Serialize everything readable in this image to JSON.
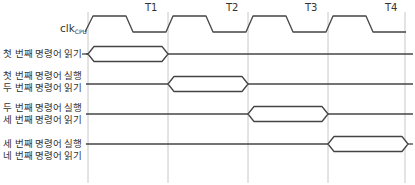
{
  "clock": {
    "label": "clk",
    "subscript": "CPU"
  },
  "periods": [
    {
      "label": "T1",
      "x": 150
    },
    {
      "label": "T2",
      "x": 231
    },
    {
      "label": "T3",
      "x": 311
    },
    {
      "label": "T4",
      "x": 391
    }
  ],
  "gridlines_x": [
    88,
    168,
    248,
    328,
    405
  ],
  "rows": [
    {
      "lines": [
        "첫 번째 명령어 읽기"
      ],
      "y": 54,
      "bus_start_x": 88,
      "bus_end_x": 168
    },
    {
      "lines": [
        "첫 번째 명령어 실행",
        "두 번째 명령어 읽기"
      ],
      "y": 84,
      "bus_start_x": 168,
      "bus_end_x": 248
    },
    {
      "lines": [
        "두 번째 명령어 실행",
        "세 번째 명령어 읽기"
      ],
      "y": 114,
      "bus_start_x": 248,
      "bus_end_x": 328
    },
    {
      "lines": [
        "세 번째 명령어 실행",
        "네 번째 명령어 읽기"
      ],
      "y": 144,
      "bus_start_x": 328,
      "bus_end_x": 408
    }
  ],
  "colors": {
    "signal": "#444444",
    "gridline": "#c8c8c8",
    "text": "#333333"
  }
}
